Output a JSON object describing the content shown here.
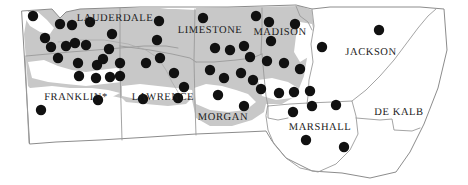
{
  "figure": {
    "type": "choropleth-dot-map",
    "width": 468,
    "height": 185,
    "background_color": "#ffffff",
    "shaded_region_color": "#c8c8c8",
    "unshaded_region_color": "#ffffff",
    "border_color": "#9a9a9a",
    "dot_color": "#111111",
    "dot_radius": 5.2,
    "label_color": "#1a1a1a"
  },
  "counties": [
    {
      "name": "LAUDERDALE",
      "label_x": 115,
      "label_y": 18,
      "shaded": true
    },
    {
      "name": "LIMESTONE",
      "label_x": 210,
      "label_y": 30,
      "shaded": true
    },
    {
      "name": "MADISON",
      "label_x": 280,
      "label_y": 32,
      "shaded": true
    },
    {
      "name": "JACKSON",
      "label_x": 371,
      "label_y": 52,
      "shaded": false
    },
    {
      "name": "FRANKLIN*",
      "label_x": 76,
      "label_y": 97,
      "shaded": true
    },
    {
      "name": "LAWRENCE",
      "label_x": 163,
      "label_y": 97,
      "shaded": true
    },
    {
      "name": "MORGAN",
      "label_x": 223,
      "label_y": 117,
      "shaded": true
    },
    {
      "name": "MARSHALL",
      "label_x": 320,
      "label_y": 127,
      "shaded": false
    },
    {
      "name": "DE KALB",
      "label_x": 399,
      "label_y": 112,
      "shaded": false
    }
  ],
  "dots": [
    {
      "x": 33,
      "y": 16
    },
    {
      "x": 60,
      "y": 24
    },
    {
      "x": 45,
      "y": 38
    },
    {
      "x": 72,
      "y": 25
    },
    {
      "x": 90,
      "y": 22
    },
    {
      "x": 112,
      "y": 34
    },
    {
      "x": 51,
      "y": 47
    },
    {
      "x": 66,
      "y": 46
    },
    {
      "x": 75,
      "y": 43
    },
    {
      "x": 86,
      "y": 45
    },
    {
      "x": 58,
      "y": 58
    },
    {
      "x": 78,
      "y": 63
    },
    {
      "x": 97,
      "y": 65
    },
    {
      "x": 109,
      "y": 49
    },
    {
      "x": 103,
      "y": 59
    },
    {
      "x": 120,
      "y": 63
    },
    {
      "x": 79,
      "y": 76
    },
    {
      "x": 96,
      "y": 78
    },
    {
      "x": 110,
      "y": 77
    },
    {
      "x": 120,
      "y": 76
    },
    {
      "x": 41,
      "y": 110
    },
    {
      "x": 98,
      "y": 100
    },
    {
      "x": 143,
      "y": 99
    },
    {
      "x": 178,
      "y": 98
    },
    {
      "x": 159,
      "y": 21
    },
    {
      "x": 157,
      "y": 40
    },
    {
      "x": 160,
      "y": 58
    },
    {
      "x": 146,
      "y": 63
    },
    {
      "x": 174,
      "y": 73
    },
    {
      "x": 184,
      "y": 87
    },
    {
      "x": 203,
      "y": 18
    },
    {
      "x": 215,
      "y": 48
    },
    {
      "x": 230,
      "y": 50
    },
    {
      "x": 244,
      "y": 46
    },
    {
      "x": 210,
      "y": 70
    },
    {
      "x": 224,
      "y": 78
    },
    {
      "x": 241,
      "y": 73
    },
    {
      "x": 253,
      "y": 80
    },
    {
      "x": 218,
      "y": 95
    },
    {
      "x": 244,
      "y": 106
    },
    {
      "x": 256,
      "y": 16
    },
    {
      "x": 269,
      "y": 22
    },
    {
      "x": 295,
      "y": 24
    },
    {
      "x": 271,
      "y": 41
    },
    {
      "x": 250,
      "y": 57
    },
    {
      "x": 267,
      "y": 61
    },
    {
      "x": 284,
      "y": 63
    },
    {
      "x": 300,
      "y": 69
    },
    {
      "x": 261,
      "y": 89
    },
    {
      "x": 279,
      "y": 93
    },
    {
      "x": 294,
      "y": 92
    },
    {
      "x": 310,
      "y": 91
    },
    {
      "x": 322,
      "y": 47
    },
    {
      "x": 379,
      "y": 30
    },
    {
      "x": 312,
      "y": 106
    },
    {
      "x": 336,
      "y": 105
    },
    {
      "x": 293,
      "y": 112
    },
    {
      "x": 306,
      "y": 140
    },
    {
      "x": 344,
      "y": 147
    }
  ],
  "accessibility": {
    "title": "Map of north Alabama counties with dot locations",
    "note": "Shaded counties are gray; unshaded counties are white"
  }
}
